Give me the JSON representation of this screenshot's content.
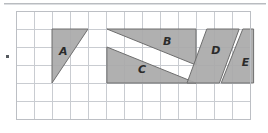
{
  "figure": {
    "grid": {
      "origin_x": 16,
      "origin_y": 11,
      "cell": 18,
      "cols": 13,
      "rows": 6,
      "line_color": "#c9ccd1",
      "outer_color": "#bcbfc4",
      "background": "#ffffff"
    },
    "style": {
      "fill": "#a9a9a9",
      "fill_light": "#b4b4b4",
      "stroke": "#6e6e6e",
      "label_color": "#2b2b2b",
      "rule_color": "#b9bcc0",
      "dot_color": "#555a5f"
    },
    "decorations": {
      "top_rule": true,
      "left_bullet": true
    },
    "shapes": [
      {
        "id": "shape-a",
        "label": "A",
        "kind": "triangle",
        "points_cells": [
          [
            2,
            1
          ],
          [
            4,
            1
          ],
          [
            2,
            4
          ]
        ],
        "label_cell": [
          2.62,
          2.3
        ],
        "base_units": 2,
        "height_units": 3,
        "area_units": 3
      },
      {
        "id": "shape-b",
        "label": "B",
        "kind": "triangle",
        "points_cells": [
          [
            5.05,
            1
          ],
          [
            10,
            1
          ],
          [
            10,
            3
          ]
        ],
        "label_cell": [
          8.4,
          1.7
        ],
        "base_units": 5,
        "height_units": 2,
        "area_units": 5
      },
      {
        "id": "shape-c",
        "label": "C",
        "kind": "triangle",
        "points_cells": [
          [
            5.05,
            2
          ],
          [
            10,
            4
          ],
          [
            5.05,
            4
          ]
        ],
        "label_cell": [
          7.0,
          3.3
        ],
        "base_units": 5,
        "height_units": 2,
        "area_units": 5
      },
      {
        "id": "shape-d",
        "label": "D",
        "kind": "parallelogram",
        "points_cells": [
          [
            10.6,
            1
          ],
          [
            12.4,
            1
          ],
          [
            11.3,
            4
          ],
          [
            9.5,
            4
          ]
        ],
        "label_cell": [
          11.1,
          2.2
        ],
        "base_units": 2,
        "height_units": 3,
        "area_units": 6
      },
      {
        "id": "shape-e",
        "label": "E",
        "kind": "parallelogram",
        "points_cells": [
          [
            13.2,
            1
          ],
          [
            13.2,
            4
          ],
          [
            11.4,
            4
          ],
          [
            12.6,
            1
          ]
        ],
        "label_cell": [
          12.75,
          2.9
        ],
        "base_units": 2,
        "height_units": 3,
        "area_units": 6
      }
    ]
  }
}
